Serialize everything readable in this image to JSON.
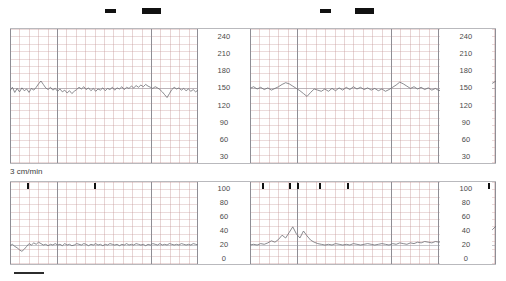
{
  "document": {
    "kind": "cardiotocography-strip",
    "paper_speed_label": "3 cm/min"
  },
  "colors": {
    "grid_minor": "#c49696",
    "grid_major": "#8e8e95",
    "trace": "#6d6d73",
    "marker": "#111111",
    "panel_border": "#b9b9bd",
    "background": "#ffffff"
  },
  "fhr_panel": {
    "name": "fetal-heart-rate",
    "unit": "bpm",
    "y_ticks": [
      240,
      210,
      180,
      150,
      120,
      90,
      60,
      30
    ],
    "ylim": [
      30,
      240
    ],
    "baseline": 150,
    "scale_columns": [
      "left-center",
      "right"
    ]
  },
  "toco_panel": {
    "name": "uterine-activity-toco",
    "unit": "",
    "y_ticks": [
      100,
      80,
      60,
      40,
      20,
      0
    ],
    "ylim": [
      0,
      100
    ],
    "baseline": 20,
    "scale_columns": [
      "left-center",
      "right"
    ]
  },
  "event_markers": {
    "row_label": "fetal-movement-markers",
    "dashes": [
      {
        "x": 105,
        "y": 9,
        "w": 11,
        "h": 4
      },
      {
        "x": 142,
        "y": 8,
        "w": 19,
        "h": 6
      },
      {
        "x": 320,
        "y": 9,
        "w": 11,
        "h": 4
      },
      {
        "x": 355,
        "y": 8,
        "w": 19,
        "h": 6
      }
    ]
  },
  "toco_ticks": {
    "label": "contraction-event-ticks",
    "positions": [
      17,
      84,
      252,
      279,
      287,
      309,
      337,
      478
    ]
  },
  "chart_data": [
    {
      "type": "line",
      "title": "Fetal Heart Rate",
      "xlabel": "",
      "ylabel": "bpm",
      "ylim": [
        30,
        240
      ],
      "grid": true,
      "legend": "none",
      "yticks": [
        240,
        210,
        180,
        150,
        120,
        90,
        60,
        30
      ],
      "baseline_bpm": 150,
      "series": [
        {
          "name": "FHR left channel",
          "values": [
            146,
            152,
            143,
            150,
            144,
            151,
            146,
            149,
            143,
            150,
            147,
            152,
            158,
            163,
            157,
            151,
            148,
            152,
            147,
            150,
            145,
            149,
            144,
            147,
            142,
            146,
            141,
            145,
            148,
            152,
            149,
            153,
            148,
            151,
            146,
            150,
            145,
            149,
            147,
            151,
            146,
            150,
            148,
            152,
            147,
            151,
            149,
            153,
            148,
            152,
            150,
            154,
            151,
            155,
            152,
            156,
            153,
            157,
            154,
            152,
            150,
            153,
            151,
            148,
            144,
            139,
            134,
            141,
            148,
            152,
            149,
            151,
            147,
            150,
            146,
            149,
            145,
            148,
            144,
            147
          ]
        },
        {
          "name": "FHR right channel",
          "values": [
            150,
            153,
            149,
            152,
            148,
            151,
            147,
            150,
            153,
            157,
            160,
            158,
            154,
            150,
            146,
            141,
            136,
            143,
            149,
            147,
            145,
            149,
            145,
            150,
            146,
            151,
            147,
            152,
            148,
            153,
            149,
            152,
            148,
            151,
            147,
            150,
            146,
            149,
            145,
            148,
            152,
            156,
            161,
            158,
            154,
            150,
            153,
            149,
            152,
            148,
            151,
            147,
            150,
            146,
            149,
            152,
            148,
            151,
            147,
            150,
            146,
            149,
            145,
            148,
            144,
            147,
            151,
            155,
            159,
            163
          ]
        }
      ]
    },
    {
      "type": "line",
      "title": "Uterine Activity (TOCO)",
      "xlabel": "",
      "ylabel": "",
      "ylim": [
        0,
        100
      ],
      "grid": true,
      "legend": "none",
      "yticks": [
        100,
        80,
        60,
        40,
        20,
        0
      ],
      "baseline": 20,
      "series": [
        {
          "name": "TOCO left channel",
          "values": [
            19,
            21,
            18,
            16,
            13,
            11,
            14,
            18,
            22,
            20,
            23,
            21,
            24,
            22,
            20,
            21,
            19,
            21,
            20,
            22,
            20,
            21,
            19,
            22,
            20,
            21,
            19,
            20,
            22,
            21,
            20,
            22,
            21,
            19,
            21,
            20,
            22,
            20,
            21,
            19,
            21,
            20,
            22,
            21,
            20,
            21,
            19,
            21,
            20,
            22,
            20,
            21,
            20,
            22,
            21,
            20,
            21,
            19,
            21,
            20,
            22,
            21,
            20,
            22,
            20,
            21,
            20,
            22,
            21,
            20,
            21,
            20,
            22,
            21,
            20,
            21,
            20,
            22,
            21,
            20
          ]
        },
        {
          "name": "TOCO right channel",
          "values": [
            20,
            21,
            20,
            22,
            21,
            23,
            26,
            24,
            28,
            34,
            30,
            38,
            46,
            36,
            30,
            40,
            33,
            27,
            24,
            22,
            21,
            20,
            21,
            20,
            22,
            21,
            20,
            21,
            20,
            22,
            21,
            20,
            21,
            22,
            21,
            20,
            21,
            22,
            21,
            20,
            22,
            21,
            23,
            22,
            21,
            23,
            22,
            24,
            23,
            25,
            24,
            23,
            25,
            24,
            26,
            25,
            24,
            26,
            28,
            30,
            29,
            31,
            30,
            32,
            31,
            33,
            35,
            38,
            42,
            47
          ]
        }
      ]
    }
  ]
}
